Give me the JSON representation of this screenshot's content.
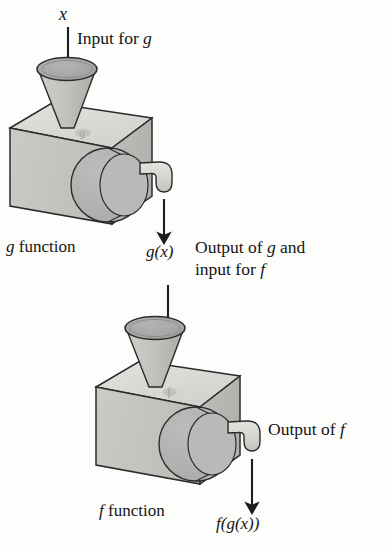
{
  "figure": {
    "type": "process-diagram",
    "background_color": "#fdfdfc",
    "ink_color": "#151515"
  },
  "labels": {
    "input_variable": "x",
    "input_for_g": "Input for g",
    "g_function": "g function",
    "g_of_x": "g(x)",
    "output_of_g_line1": "Output of g and",
    "output_of_g_line2": "input for f",
    "f_function": "f function",
    "output_of_f": "Output of f",
    "f_of_g_of_x": "f(g(x))"
  },
  "machines": [
    {
      "name": "g-machine",
      "label": "g function",
      "dial_marking": "g",
      "has_funnel": true,
      "has_dial": true,
      "has_spout": true
    },
    {
      "name": "f-machine",
      "label": "f function",
      "dial_marking": "f",
      "has_funnel": true,
      "has_dial": true,
      "has_spout": true
    }
  ],
  "flow": [
    {
      "from": "x",
      "to": "g-machine-funnel",
      "arrow": "down"
    },
    {
      "from": "g-machine-spout",
      "to": "g(x)",
      "arrow": "down"
    },
    {
      "from": "g(x)",
      "to": "f-machine-funnel",
      "arrow": "down"
    },
    {
      "from": "f-machine-spout",
      "to": "f(g(x))",
      "arrow": "down"
    }
  ],
  "palette": {
    "top_face": "#d9d9d6",
    "left_face": "#c4c4c2",
    "front_face": "#b9b9b7",
    "dial_face": "#b2b2b0",
    "funnel_bowl": "#a8a8a6",
    "funnel_cone": "#c2c2c0",
    "spout": "#d6d6d3",
    "outline": "#2b2b2b"
  }
}
